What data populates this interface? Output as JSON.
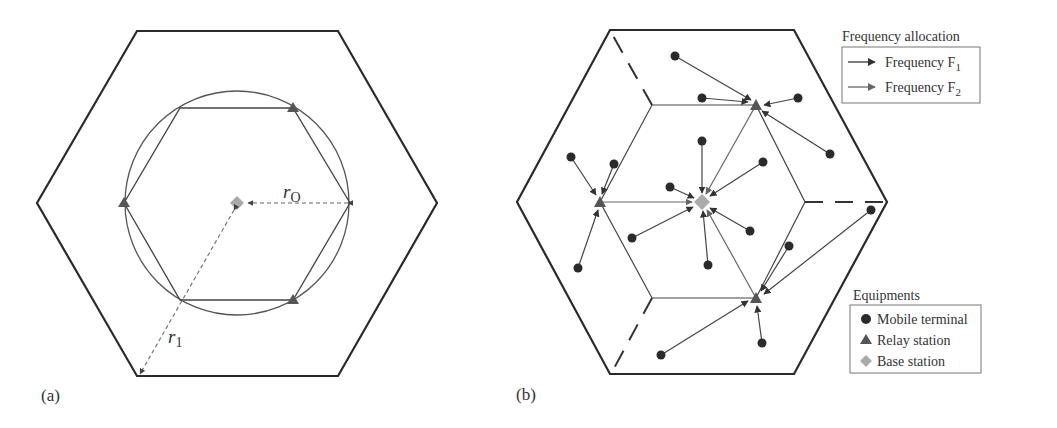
{
  "colors": {
    "outline": "#2a2a2a",
    "line": "#555555",
    "arrow_f1": "#333333",
    "arrow_f2": "#6a6a6a",
    "terminal": "#2b2b2b",
    "relay": "#555555",
    "base": "#aaaaaa"
  },
  "panel_a": {
    "label": "(a)",
    "r_outer_label": "r",
    "r_outer_sub": "O",
    "r_inner_label": "r",
    "r_inner_sub": "1"
  },
  "panel_b": {
    "label": "(b)",
    "legend_frequency": {
      "title": "Frequency allocation",
      "items": [
        {
          "label": "Frequency F",
          "sub": "1"
        },
        {
          "label": "Frequency F",
          "sub": "2"
        }
      ]
    },
    "legend_equipment": {
      "title": "Equipments",
      "items": [
        {
          "label": "Mobile terminal"
        },
        {
          "label": "Relay station"
        },
        {
          "label": "Base station"
        }
      ]
    }
  }
}
